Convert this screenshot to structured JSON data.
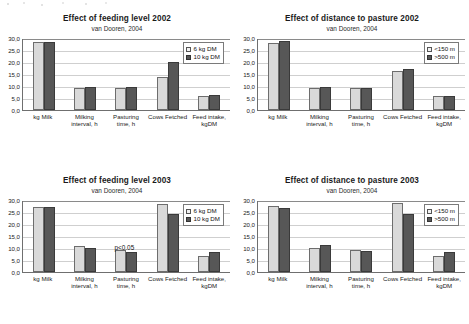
{
  "figure": {
    "categories": [
      "kg Milk",
      "Milking interval, h",
      "Pasturing time, h",
      "Cows Fetched",
      "Feed intake, kgDM"
    ],
    "yticks": [
      "30,0",
      "25,0",
      "20,0",
      "15,0",
      "10,0",
      "5,0",
      "0,0"
    ],
    "ylim": [
      0,
      30
    ],
    "subtitle": "van Dooren, 2004"
  },
  "chart_data": [
    {
      "id": "feeding-2002",
      "type": "bar",
      "title": "Effect of feeding level 2002",
      "subtitle": "van Dooren, 2004",
      "categories": [
        "kg Milk",
        "Milking interval, h",
        "Pasturing time, h",
        "Cows Fetched",
        "Feed intake, kgDM"
      ],
      "series": [
        {
          "name": "6 kg DM",
          "values": [
            28.2,
            9.1,
            9.0,
            13.6,
            5.9
          ]
        },
        {
          "name": "10 kg DM",
          "values": [
            28.4,
            9.6,
            9.5,
            20.0,
            6.4
          ]
        }
      ],
      "xlabel": "",
      "ylabel": "",
      "ylim": [
        0,
        30
      ],
      "yticks": [
        "30,0",
        "25,0",
        "20,0",
        "15,0",
        "10,0",
        "5,0",
        "0,0"
      ],
      "grid": true,
      "legend_position": "top-right",
      "annotations": []
    },
    {
      "id": "distance-2002",
      "type": "bar",
      "title": "Effect of distance to pasture 2002",
      "subtitle": "van Dooren, 2004",
      "categories": [
        "kg Milk",
        "Milking interval, h",
        "Pasturing time, h",
        "Cows Fetched",
        "Feed intake, kgDM"
      ],
      "series": [
        {
          "name": "<150 m",
          "values": [
            27.8,
            9.3,
            9.2,
            16.1,
            5.7
          ]
        },
        {
          "name": ">500 m",
          "values": [
            28.8,
            9.5,
            9.1,
            17.1,
            5.8
          ]
        }
      ],
      "xlabel": "",
      "ylabel": "",
      "ylim": [
        0,
        30
      ],
      "yticks": [
        "30,0",
        "25,0",
        "20,0",
        "15,0",
        "10,0",
        "5,0",
        "0,0"
      ],
      "grid": true,
      "legend_position": "top-right",
      "annotations": []
    },
    {
      "id": "feeding-2003",
      "type": "bar",
      "title": "Effect of feeding level 2003",
      "subtitle": "van Dooren, 2004",
      "categories": [
        "kg Milk",
        "Milking interval, h",
        "Pasturing time, h",
        "Cows Fetched",
        "Feed intake, kgDM"
      ],
      "series": [
        {
          "name": "6 kg DM",
          "values": [
            27.0,
            10.9,
            9.2,
            28.5,
            6.7
          ]
        },
        {
          "name": "10 kg DM",
          "values": [
            27.2,
            10.2,
            8.5,
            24.0,
            8.4
          ]
        }
      ],
      "xlabel": "",
      "ylabel": "",
      "ylim": [
        0,
        30
      ],
      "yticks": [
        "30,0",
        "25,0",
        "20,0",
        "15,0",
        "10,0",
        "5,0",
        "0,0"
      ],
      "grid": true,
      "legend_position": "top-right",
      "annotations": [
        {
          "text": "p<0.05",
          "category": "Pasturing time, h"
        }
      ]
    },
    {
      "id": "distance-2003",
      "type": "bar",
      "title": "Effect of distance to pasture 2003",
      "subtitle": "van Dooren, 2004",
      "categories": [
        "kg Milk",
        "Milking interval, h",
        "Pasturing time, h",
        "Cows Fetched",
        "Feed intake, kgDM"
      ],
      "series": [
        {
          "name": "<150 m",
          "values": [
            27.7,
            10.1,
            9.0,
            28.6,
            6.6
          ]
        },
        {
          "name": ">500 m",
          "values": [
            26.5,
            11.3,
            8.6,
            24.1,
            8.4
          ]
        }
      ],
      "xlabel": "",
      "ylabel": "",
      "ylim": [
        0,
        30
      ],
      "yticks": [
        "30,0",
        "25,0",
        "20,0",
        "15,0",
        "10,0",
        "5,0",
        "0,0"
      ],
      "grid": true,
      "legend_position": "top-right",
      "annotations": []
    }
  ],
  "colors": {
    "series1_fill": "#d9d9d9",
    "series2_fill": "#575757",
    "axis": "#6f6f6f",
    "grid": "#cfcfcf"
  }
}
